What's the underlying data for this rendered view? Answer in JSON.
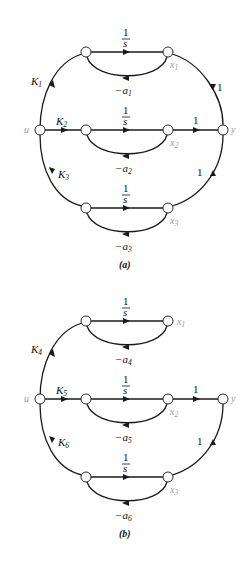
{
  "diagrams": [
    {
      "caption": "(a)",
      "nodes": {
        "input": "u",
        "output": "y",
        "states": [
          "x1",
          "x2",
          "x3"
        ]
      },
      "branches": [
        {
          "input_gain": "K1",
          "integrator": "1/s",
          "feedback": "-a1",
          "output_gain": "1"
        },
        {
          "input_gain": "K2",
          "integrator": "1/s",
          "feedback": "-a2",
          "output_gain": "1"
        },
        {
          "input_gain": "K3",
          "integrator": "1/s",
          "feedback": "-a3",
          "output_gain": "1"
        }
      ],
      "labels": {
        "u": "u",
        "y": "y",
        "k1_base": "K",
        "k1_sub": "1",
        "k2_base": "K",
        "k2_sub": "2",
        "k3_base": "K",
        "k3_sub": "3",
        "a1_base": "−a",
        "a1_sub": "1",
        "a2_base": "−a",
        "a2_sub": "2",
        "a3_base": "−a",
        "a3_sub": "3",
        "x1_base": "x",
        "x1_sub": "1",
        "x2_base": "x",
        "x2_sub": "2",
        "x3_base": "x",
        "x3_sub": "3",
        "int_num": "1",
        "int_den": "s",
        "one": "1"
      }
    },
    {
      "caption": "(b)",
      "nodes": {
        "input": "u",
        "output": "y",
        "states": [
          "x1",
          "x2",
          "x3"
        ]
      },
      "branches": [
        {
          "input_gain": "K4",
          "integrator": "1/s",
          "feedback": "-a4",
          "output_gain": null
        },
        {
          "input_gain": "K5",
          "integrator": "1/s",
          "feedback": "-a5",
          "output_gain": "1"
        },
        {
          "input_gain": "K6",
          "integrator": "1/s",
          "feedback": "-a6",
          "output_gain": "1"
        }
      ],
      "labels": {
        "u": "u",
        "y": "y",
        "k1_base": "K",
        "k1_sub": "4",
        "k2_base": "K",
        "k2_sub": "5",
        "k3_base": "K",
        "k3_sub": "6",
        "a1_base": "−a",
        "a1_sub": "4",
        "a2_base": "−a",
        "a2_sub": "5",
        "a3_base": "−a",
        "a3_sub": "6",
        "x1_base": "x",
        "x1_sub": "1",
        "x2_base": "x",
        "x2_sub": "2",
        "x3_base": "x",
        "x3_sub": "3",
        "int_num": "1",
        "int_den": "s",
        "one": "1"
      }
    }
  ]
}
